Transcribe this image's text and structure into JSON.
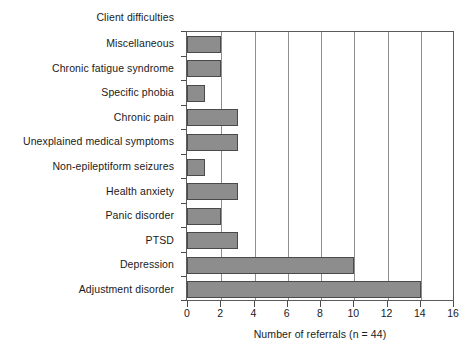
{
  "chart_data": {
    "type": "bar",
    "orientation": "horizontal",
    "title": "",
    "xlabel": "Number of referrals (n = 44)",
    "ylabel": "Client difficulties",
    "xlim": [
      0,
      16
    ],
    "xticks": [
      0,
      2,
      4,
      6,
      8,
      10,
      12,
      14,
      16
    ],
    "xtick_labels": [
      "0",
      "2",
      "4",
      "6",
      "8",
      "10",
      "12",
      "14",
      "16"
    ],
    "grid": "vertical",
    "legend": "none",
    "bar_color": "#8d8d8d",
    "bar_edge_color": "#4a4a4a",
    "categories": [
      "Miscellaneous",
      "Chronic fatigue syndrome",
      "Specific phobia",
      "Chronic pain",
      "Unexplained medical symptoms",
      "Non-epileptiform seizures",
      "Health anxiety",
      "Panic disorder",
      "PTSD",
      "Depression",
      "Adjustment disorder"
    ],
    "values": [
      2,
      2,
      1,
      3,
      3,
      1,
      3,
      2,
      3,
      10,
      14
    ]
  }
}
